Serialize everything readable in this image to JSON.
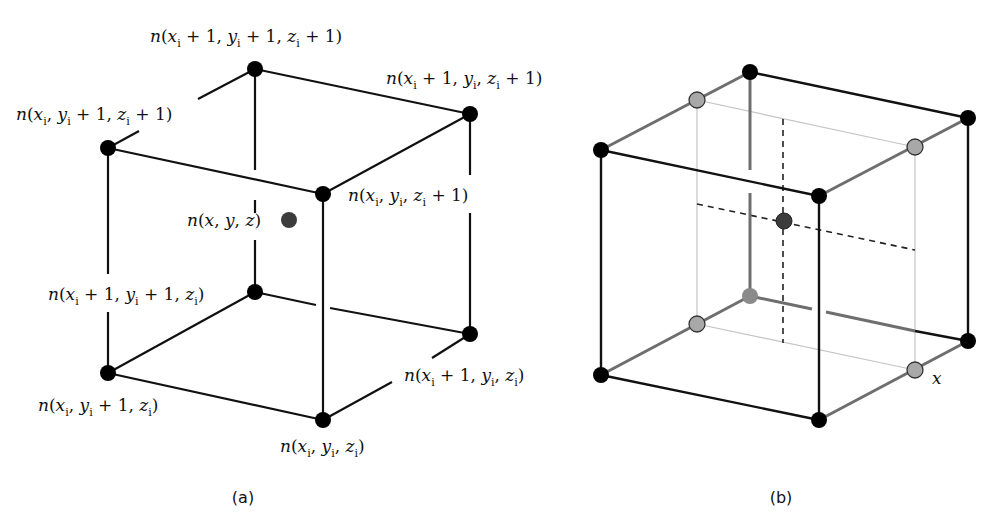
{
  "figure": {
    "panels": [
      {
        "id": "a",
        "caption": "(a)",
        "description": "Cube of 8 lattice nodes surrounding an interior point n(x, y, z)",
        "node_labels": {
          "top_back": "n(xi + 1, yi + 1, zi + 1)",
          "top_right": "n(xi + 1, yi, zi + 1)",
          "top_left": "n(xi, yi + 1, zi + 1)",
          "top_front": "n(xi, yi, zi + 1)",
          "interior": "n(x, y, z)",
          "bottom_back": "n(xi + 1, yi + 1, zi)",
          "bottom_right": "n(xi + 1, yi, zi)",
          "bottom_left": "n(xi, yi + 1, zi)",
          "bottom_front": "n(xi, yi, zi)"
        }
      },
      {
        "id": "b",
        "caption": "(b)",
        "description": "Trilinear interpolation: gray intermediate points interpolated along x, dashed lines through interior point",
        "axis_label": "x"
      }
    ],
    "colors": {
      "corner_node": "#000000",
      "interior_node": "#3c3c3c",
      "intermediate_node": "#a8a8a8",
      "edge": "#111111",
      "gray_edge": "#6e6e6e",
      "guide_line": "#bdbdbd"
    }
  }
}
